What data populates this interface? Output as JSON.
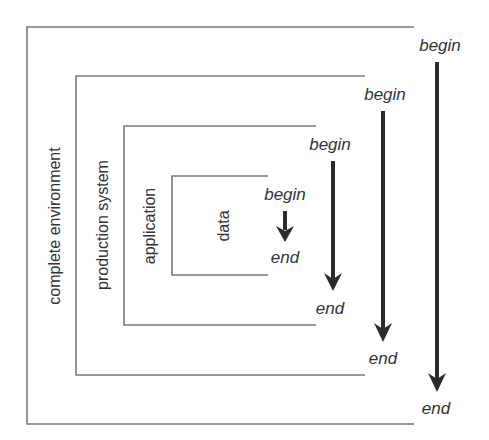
{
  "diagram": {
    "title": "",
    "colors": {
      "box_stroke": "#7a7a7a",
      "arrow": "#2b2b2b",
      "text": "#333333",
      "background": "#ffffff"
    },
    "layers": [
      {
        "id": "complete-environment",
        "label": "complete environment",
        "begin": "begin",
        "end": "end"
      },
      {
        "id": "production-system",
        "label": "production system",
        "begin": "begin",
        "end": "end"
      },
      {
        "id": "application",
        "label": "application",
        "begin": "begin",
        "end": "end"
      },
      {
        "id": "data",
        "label": "data",
        "begin": "begin",
        "end": "end"
      }
    ]
  }
}
